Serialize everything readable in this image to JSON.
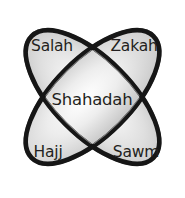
{
  "diagram": {
    "type": "venn-four-petal",
    "background_color": "#ffffff",
    "outline_color": "#161616",
    "fill_gradient": {
      "center_color": "#fdfdfd",
      "mid_color": "#e2e2e2",
      "edge_color": "#b9b9b9"
    },
    "inner_line_color": "#6f6f6f",
    "text_color": "#231f20",
    "labels": [
      {
        "id": "top-left",
        "text": "Salah",
        "x": 52,
        "y": 47
      },
      {
        "id": "top-right",
        "text": "Zakah",
        "x": 134,
        "y": 47
      },
      {
        "id": "center",
        "text": "Shahadah",
        "x": 92,
        "y": 100
      },
      {
        "id": "bottom-left",
        "text": "Hajj",
        "x": 48,
        "y": 153
      },
      {
        "id": "bottom-right",
        "text": "Sawm",
        "x": 136,
        "y": 153
      }
    ],
    "ellipses": [
      {
        "id": "ellipse-nw-se",
        "rotation_deg": 45,
        "cx": 92.5,
        "cy": 97,
        "rx": 88,
        "ry": 40
      },
      {
        "id": "ellipse-ne-sw",
        "rotation_deg": -45,
        "cx": 92.5,
        "cy": 97,
        "rx": 88,
        "ry": 40
      }
    ]
  }
}
